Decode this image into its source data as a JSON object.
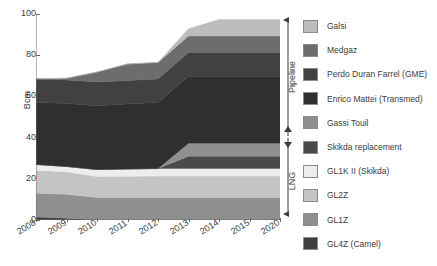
{
  "chart_data": {
    "type": "area",
    "stacked": true,
    "title": "",
    "xlabel": "",
    "ylabel": "Bcm",
    "ylim": [
      0,
      100
    ],
    "yticks": [
      0,
      20,
      40,
      60,
      80,
      100
    ],
    "grid": false,
    "legend_position": "right",
    "categories": [
      "2008",
      "2009",
      "2010",
      "2011",
      "2012",
      "2013",
      "2014",
      "2015",
      "2020"
    ],
    "series": [
      {
        "name": "GL4Z (Camel)",
        "color": "#3f3f3f",
        "values": [
          1.5,
          0.9,
          0,
          0,
          0,
          0,
          0,
          0,
          0
        ]
      },
      {
        "name": "GL1Z",
        "color": "#8f8f8f",
        "values": [
          11.5,
          11.6,
          10.9,
          10.9,
          10.9,
          10.9,
          10.9,
          10.9,
          10.9
        ]
      },
      {
        "name": "GL2Z",
        "color": "#c4c4c4",
        "values": [
          11.0,
          10.9,
          10.2,
          10.3,
          10.4,
          10.4,
          10.4,
          10.4,
          10.4
        ]
      },
      {
        "name": "GL1K II (Skikda)",
        "color": "#ededed",
        "values": [
          3.0,
          2.6,
          3.4,
          3.6,
          3.7,
          3.7,
          3.7,
          3.7,
          3.7
        ]
      },
      {
        "name": "Skikda replacement",
        "color": "#4a4a4a",
        "values": [
          0,
          0,
          0,
          0,
          0,
          6.0,
          6.0,
          6.0,
          6.0
        ]
      },
      {
        "name": "Gassi Touil",
        "color": "#909090",
        "values": [
          0,
          0,
          0,
          0,
          0,
          6.3,
          6.3,
          6.3,
          6.3
        ]
      },
      {
        "name": "Enrico Mattei (Transmed)",
        "color": "#2f2f2f",
        "values": [
          30.0,
          30.5,
          31.0,
          31.5,
          32.0,
          32.5,
          32.5,
          32.5,
          32.5
        ]
      },
      {
        "name": "Perdo Duran Farrel (GME)",
        "color": "#414141",
        "values": [
          11.5,
          11.5,
          11.5,
          11.4,
          11.5,
          11.5,
          11.5,
          11.5,
          11.5
        ]
      },
      {
        "name": "Medgaz",
        "color": "#6d6d6d",
        "values": [
          0,
          0.8,
          4.8,
          8.0,
          8.0,
          8.0,
          8.0,
          8.0,
          8.0
        ]
      },
      {
        "name": "Galsi",
        "color": "#bdbdbd",
        "values": [
          0,
          0,
          0,
          0,
          0,
          3.6,
          8.0,
          8.0,
          8.0
        ]
      }
    ],
    "totals": [
      68.5,
      68.8,
      71.8,
      75.7,
      76.5,
      92.9,
      97.3,
      97.3,
      97.3
    ],
    "annotations": [
      {
        "label": "Pipeline",
        "from": 40,
        "to": 100
      },
      {
        "label": "LNG",
        "from": 0,
        "to": 40
      }
    ]
  },
  "legend": {
    "items": [
      {
        "label": "Galsi",
        "color": "#bdbdbd"
      },
      {
        "label": "Medgaz",
        "color": "#6d6d6d"
      },
      {
        "label": "Perdo Duran Farrel (GME)",
        "color": "#414141"
      },
      {
        "label": "Enrico Mattei (Transmed)",
        "color": "#2f2f2f"
      },
      {
        "label": "Gassi Touil",
        "color": "#909090"
      },
      {
        "label": "Skikda replacement",
        "color": "#4a4a4a"
      },
      {
        "label": "GL1K II (Skikda)",
        "color": "#ededed"
      },
      {
        "label": "GL2Z",
        "color": "#c4c4c4"
      },
      {
        "label": "GL1Z",
        "color": "#8f8f8f"
      },
      {
        "label": "GL4Z (Camel)",
        "color": "#3f3f3f"
      }
    ]
  },
  "axis": {
    "y_title": "Bcm",
    "y_ticks": [
      "0",
      "20",
      "40",
      "60",
      "80",
      "100"
    ],
    "x_ticks": [
      "2008",
      "2009",
      "2010",
      "2011",
      "2012",
      "2013",
      "2014",
      "2015",
      "2020"
    ]
  },
  "brackets": {
    "pipeline_label": "Pipeline",
    "lng_label": "LNG"
  }
}
